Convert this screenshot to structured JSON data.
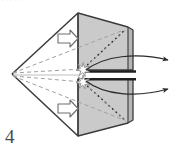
{
  "figure": {
    "label": "4",
    "header_fragment": "· · · · · ·",
    "caption": "",
    "colors": {
      "face_front_fill": "#c9c9c9",
      "face_top_fill": "#d6d6d6",
      "face_side_fill": "#b9b9b9",
      "outline": "#3a3a3a",
      "ray_dotted": "#2b2b2b",
      "ray_dashed": "#9a9a9a",
      "axis_line": "#b0b0b0",
      "beam_line": "#2b2b2b",
      "arrow_stroke": "#3a3a3a",
      "block_arrow_fill": "#ffffff",
      "background": "#ffffff"
    },
    "elements": {
      "prism_name": "triangular-prism-body",
      "apex_name": "left-apex-vertex",
      "focus_upper": "upper-focus-star",
      "focus_lower": "lower-focus-star",
      "input_arrow_upper": "upper-input-block-arrow",
      "input_arrow_lower": "lower-input-block-arrow",
      "output_arrow_upper": "upper-output-curved-arrow",
      "output_arrow_lower": "lower-output-curved-arrow",
      "beam_upper": "upper-output-beam",
      "beam_lower": "lower-output-beam"
    },
    "geometry": {
      "apex": [
        12,
        74
      ],
      "top_front": [
        78,
        13
      ],
      "top_back": [
        128,
        27
      ],
      "bottom_front": [
        78,
        136
      ],
      "bottom_back": [
        128,
        123
      ],
      "focus_upper": [
        83,
        69
      ],
      "focus_lower": [
        83,
        82
      ],
      "right_edge_x": 128
    }
  }
}
